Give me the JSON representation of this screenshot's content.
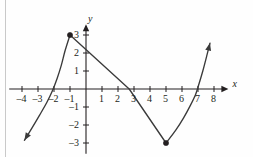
{
  "figure": {
    "title": "",
    "axis_color": "#231f20",
    "curve_color": "#3a3a3a",
    "point_color": "#231f20",
    "background": "#fefefe",
    "rule_color": "#c9c9c9"
  },
  "axes": {
    "x_name": "x",
    "y_name": "y",
    "origin_px": {
      "x": 86,
      "y": 89
    },
    "unit_px": {
      "x": 16,
      "y": 18
    },
    "x_labels": [
      {
        "value": -4,
        "text": "–4"
      },
      {
        "value": -3,
        "text": "–3"
      },
      {
        "value": -2,
        "text": "–2"
      },
      {
        "value": -1,
        "text": "–1"
      },
      {
        "value": 1,
        "text": "1"
      },
      {
        "value": 2,
        "text": "2"
      },
      {
        "value": 3,
        "text": "3"
      },
      {
        "value": 4,
        "text": "4"
      },
      {
        "value": 5,
        "text": "5"
      },
      {
        "value": 6,
        "text": "6"
      },
      {
        "value": 7,
        "text": "7"
      },
      {
        "value": 8,
        "text": "8"
      }
    ],
    "y_labels": [
      {
        "value": 3,
        "text": "3"
      },
      {
        "value": 2,
        "text": "2"
      },
      {
        "value": 1,
        "text": "1"
      },
      {
        "value": -1,
        "text": "–1"
      },
      {
        "value": -2,
        "text": "–2"
      },
      {
        "value": -3,
        "text": "–3"
      }
    ]
  },
  "chart_data": {
    "type": "line",
    "title": "",
    "xlabel": "x",
    "ylabel": "y",
    "xlim": [
      -4.8,
      8.9
    ],
    "ylim": [
      -3.6,
      3.6
    ],
    "grid": false,
    "legend": "none",
    "xticks": [
      -4,
      -3,
      -2,
      -1,
      1,
      2,
      3,
      4,
      5,
      6,
      7,
      8
    ],
    "yticks": [
      3,
      2,
      1,
      -1,
      -2,
      -3
    ],
    "series": [
      {
        "name": "left-branch",
        "kind": "curve",
        "arrow_start": true,
        "arrow_end": false,
        "points": [
          [
            -3.85,
            -2.85
          ],
          [
            -3.4,
            -2.2
          ],
          [
            -2.9,
            -1.45
          ],
          [
            -2.45,
            -0.75
          ],
          [
            -2.1,
            -0.1
          ],
          [
            -1.8,
            0.6
          ],
          [
            -1.55,
            1.3
          ],
          [
            -1.3,
            2.15
          ],
          [
            -1.0,
            3.0
          ]
        ]
      },
      {
        "name": "descending-segment",
        "kind": "line",
        "arrow_start": false,
        "arrow_end": false,
        "points": [
          [
            -1.0,
            3.0
          ],
          [
            2.7,
            0.0
          ],
          [
            5.0,
            -3.0
          ]
        ]
      },
      {
        "name": "right-branch",
        "kind": "curve",
        "arrow_start": false,
        "arrow_end": true,
        "points": [
          [
            5.0,
            -3.0
          ],
          [
            5.6,
            -2.3
          ],
          [
            6.1,
            -1.6
          ],
          [
            6.5,
            -0.95
          ],
          [
            6.85,
            -0.3
          ],
          [
            7.05,
            0.25
          ],
          [
            7.3,
            1.0
          ],
          [
            7.55,
            1.85
          ],
          [
            7.75,
            2.55
          ]
        ]
      }
    ],
    "marked_points": [
      {
        "label": "local-max",
        "x": -1,
        "y": 3,
        "style": "filled"
      },
      {
        "label": "local-min",
        "x": 5,
        "y": -3,
        "style": "filled"
      }
    ],
    "annotations": []
  }
}
